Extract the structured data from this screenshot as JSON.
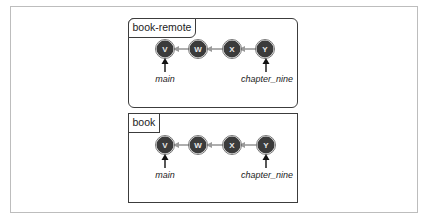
{
  "diagram": {
    "repos": [
      {
        "id": "remote",
        "label": "book-remote",
        "commits": [
          "V",
          "W",
          "X",
          "Y"
        ],
        "branches": [
          {
            "name": "main",
            "points_to": "V"
          },
          {
            "name": "chapter_nine",
            "points_to": "Y"
          }
        ]
      },
      {
        "id": "local",
        "label": "book",
        "commits": [
          "V",
          "W",
          "X",
          "Y"
        ],
        "branches": [
          {
            "name": "main",
            "points_to": "V"
          },
          {
            "name": "chapter_nine",
            "points_to": "Y"
          }
        ]
      }
    ],
    "colors": {
      "commit_fill": "#3b3b3b",
      "commit_text": "#e8e8e8",
      "edge": "#9a9a9a",
      "pointer": "#111111",
      "border": "#3c3c3c"
    }
  }
}
